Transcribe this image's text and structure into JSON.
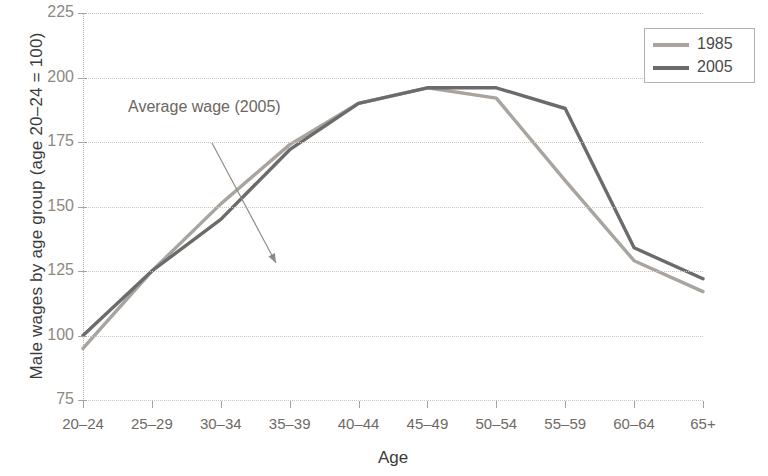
{
  "chart_data": {
    "type": "line",
    "title": "",
    "xlabel": "Age",
    "ylabel": "Male wages by age group (age 20–24 = 100)",
    "categories": [
      "20–24",
      "25–29",
      "30–34",
      "35–39",
      "40–44",
      "45–49",
      "50–54",
      "55–59",
      "60–64",
      "65+"
    ],
    "series": [
      {
        "name": "1985",
        "color": "#a9a49e",
        "values": [
          95,
          125,
          151,
          174,
          190,
          196,
          192,
          160,
          129,
          117
        ]
      },
      {
        "name": "2005",
        "color": "#6b6b6b",
        "values": [
          100,
          125,
          145,
          172,
          190,
          196,
          196,
          188,
          134,
          122
        ]
      }
    ],
    "ylim": [
      75,
      225
    ],
    "yticks": [
      75,
      100,
      125,
      150,
      175,
      200,
      225
    ],
    "ytick_labels": [
      "75",
      "100",
      "125",
      "150",
      "175",
      "200",
      "225"
    ],
    "grid": true,
    "legend_position": "top-right",
    "annotations": [
      {
        "text": "Average wage (2005)",
        "arrow_from": {
          "x": 212,
          "y": 143
        },
        "arrow_to": {
          "x": 276,
          "y": 263
        }
      }
    ]
  },
  "legend": {
    "items": [
      {
        "label": "1985",
        "color": "#a9a49e"
      },
      {
        "label": "2005",
        "color": "#6b6b6b"
      }
    ]
  },
  "axes": {
    "y_title": "Male wages by age group (age 20–24 = 100)",
    "x_title": "Age"
  }
}
